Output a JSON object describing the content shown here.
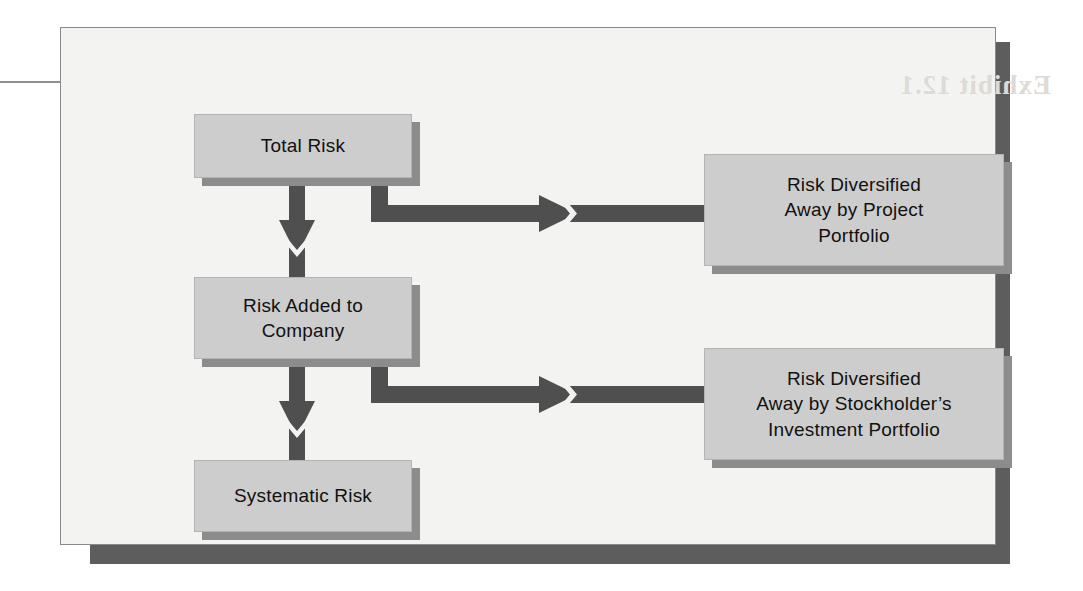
{
  "exhibit": {
    "title": "Risk diversification flow diagram",
    "background_color": "#f3f3f1",
    "panel_shadow_color": "#5d5d5d",
    "node_fill_color": "#cdcdcd",
    "node_shadow_color": "#8c8c8c",
    "connector_color": "#4f4f4f",
    "bleed_through_text": "Exhibit 12.1"
  },
  "nodes": {
    "total_risk": {
      "label": "Total Risk"
    },
    "risk_added": {
      "label": "Risk Added to\nCompany"
    },
    "risk_added_line1": "Risk Added to",
    "risk_added_line2": "Company",
    "systematic_risk": {
      "label": "Systematic Risk"
    },
    "diversified_project": {
      "line1": "Risk Diversified",
      "line2": "Away by Project",
      "line3": "Portfolio"
    },
    "diversified_stockholder": {
      "line1": "Risk Diversified",
      "line2": "Away by Stockholder’s",
      "line3": "Investment Portfolio"
    }
  },
  "connectors": [
    {
      "name": "total-risk-to-risk-added",
      "from": "Total Risk",
      "to": "Risk Added to Company",
      "direction": "down"
    },
    {
      "name": "risk-added-to-systematic-risk",
      "from": "Risk Added to Company",
      "to": "Systematic Risk",
      "direction": "down"
    },
    {
      "name": "total-risk-to-diversified-project",
      "from": "Total Risk",
      "to": "Risk Diversified Away by Project Portfolio",
      "direction": "right"
    },
    {
      "name": "risk-added-to-diversified-stockholder",
      "from": "Risk Added to Company",
      "to": "Risk Diversified Away by Stockholder’s Investment Portfolio",
      "direction": "right"
    }
  ]
}
